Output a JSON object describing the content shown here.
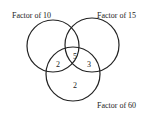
{
  "venn": {
    "sets": [
      {
        "label": "Factor of 10"
      },
      {
        "label": "Factor of 15"
      },
      {
        "label": "Factor of 60"
      }
    ],
    "regions": {
      "all_three": "5",
      "ten_and_sixty_only": "2",
      "fifteen_and_sixty_only": "3",
      "sixty_only": "2"
    }
  }
}
